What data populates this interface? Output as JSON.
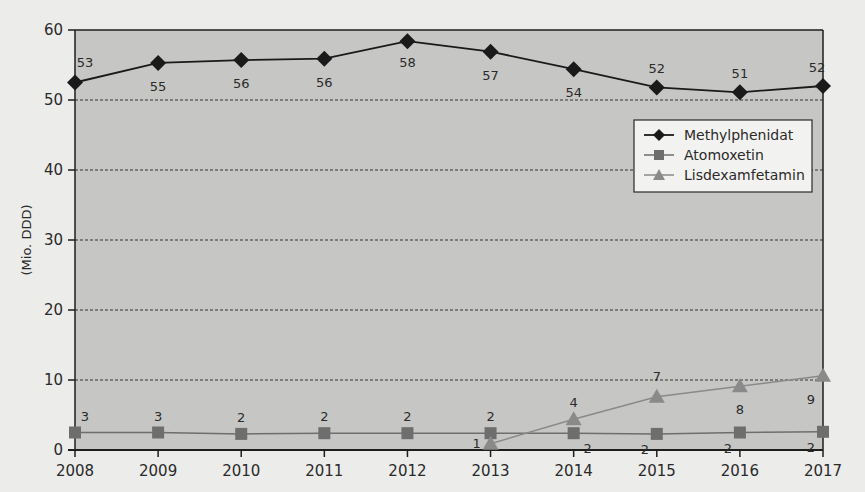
{
  "chart_data": {
    "type": "line",
    "title": "",
    "xlabel": "",
    "ylabel": "(Mio. DDD)",
    "ylim": [
      0,
      60
    ],
    "yticks": [
      0,
      10,
      20,
      30,
      40,
      50,
      60
    ],
    "grid": true,
    "legend_position": "upper-right inside",
    "x": [
      "2008",
      "2009",
      "2010",
      "2011",
      "2012",
      "2013",
      "2014",
      "2015",
      "2016",
      "2017"
    ],
    "series": [
      {
        "name": "Methylphenidat",
        "marker": "diamond",
        "color": "#1a1a1a",
        "values": [
          52.5,
          55.3,
          55.7,
          55.9,
          58.4,
          56.9,
          54.4,
          51.8,
          51.1,
          52.0
        ],
        "labels": [
          "53",
          "55",
          "56",
          "56",
          "58",
          "57",
          "54",
          "52",
          "51",
          "52"
        ]
      },
      {
        "name": "Atomoxetin",
        "marker": "square",
        "color": "#6e6e6e",
        "values": [
          2.5,
          2.5,
          2.3,
          2.4,
          2.4,
          2.4,
          2.4,
          2.3,
          2.5,
          2.6
        ],
        "labels": [
          "3",
          "3",
          "2",
          "2",
          "2",
          "2",
          "2",
          "2",
          "2",
          "2"
        ]
      },
      {
        "name": "Lisdexamfetamin",
        "marker": "triangle",
        "color": "#8a8a8a",
        "values": [
          null,
          null,
          null,
          null,
          null,
          0.9,
          4.4,
          7.6,
          9.1,
          10.6
        ],
        "labels": [
          "",
          "",
          "",
          "",
          "",
          "1",
          "4",
          "7",
          "8",
          "9"
        ]
      }
    ]
  },
  "axis": {
    "ylabel": "(Mio. DDD)",
    "yticks": [
      "0",
      "10",
      "20",
      "30",
      "40",
      "50",
      "60"
    ],
    "xticks": [
      "2008",
      "2009",
      "2010",
      "2011",
      "2012",
      "2013",
      "2014",
      "2015",
      "2016",
      "2017"
    ]
  },
  "legend": {
    "items": [
      {
        "label": "Methylphenidat"
      },
      {
        "label": "Atomoxetin"
      },
      {
        "label": "Lisdexamfetamin"
      }
    ]
  },
  "colors": {
    "plot_background": "#c6c6c4",
    "page_background": "#ececea",
    "frame": "#1e1e1e",
    "gridline": "#333333"
  }
}
